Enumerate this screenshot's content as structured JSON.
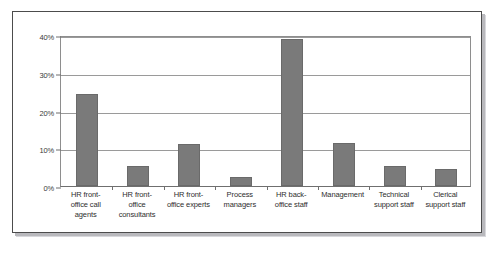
{
  "chart_data": {
    "type": "bar",
    "title": "",
    "subtitle": "",
    "xlabel": "",
    "ylabel": "",
    "categories": [
      "HR front-office call agents",
      "HR front-office consultants",
      "HR front-office experts",
      "Process managers",
      "HR back-office staff",
      "Management",
      "Technical support staff",
      "Clerical support staff"
    ],
    "category_lines": [
      [
        "HR front-",
        "office call",
        "agents"
      ],
      [
        "HR front-",
        "office",
        "consultants"
      ],
      [
        "HR front-",
        "office experts"
      ],
      [
        "Process",
        "managers"
      ],
      [
        "HR back-",
        "office staff"
      ],
      [
        "Management"
      ],
      [
        "Technical",
        "support staff"
      ],
      [
        "Clerical",
        "support staff"
      ]
    ],
    "values": [
      24.5,
      5.2,
      11.2,
      2.3,
      39.0,
      11.3,
      5.3,
      4.6
    ],
    "ylim": [
      0,
      40
    ],
    "ytick_values": [
      0,
      10,
      20,
      30,
      40
    ],
    "ytick_labels": [
      "0%",
      "10%",
      "20%",
      "30%",
      "40%"
    ],
    "grid": "horizontal",
    "legend": "none",
    "series_name": "",
    "bar_color": "#7a7a7a",
    "bar_border_color": "#6a6a6a",
    "gridline_color": "#9a9a9a",
    "axis_color": "#6f6f6f",
    "frame_border_color": "#4c4c4c",
    "frame_shadow_color": "#b9b9bd",
    "background_color": "#ffffff"
  }
}
